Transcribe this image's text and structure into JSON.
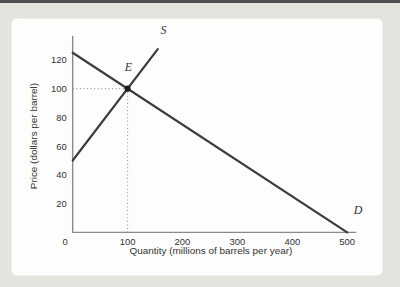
{
  "colors": {
    "background": "#e3e3e0",
    "top_bar": "#4f4f4f",
    "panel": "#fdfdfd",
    "panel_border": "#efefec",
    "axis": "#8a8a8a",
    "line": "#3c3c3c",
    "dotted": "#9a9a9a",
    "text": "#333333",
    "point": "#1c1c1c"
  },
  "chart_data": {
    "type": "line",
    "title": "",
    "xlabel": "Quantity (millions of barrels per year)",
    "ylabel": "Price (dollars per barrel)",
    "xlim": [
      0,
      500
    ],
    "ylim": [
      0,
      125
    ],
    "x_ticks": [
      0,
      100,
      200,
      300,
      400,
      500
    ],
    "y_ticks": [
      20,
      40,
      60,
      80,
      100,
      120
    ],
    "grid": false,
    "legend": "none",
    "series": [
      {
        "name": "supply",
        "label": "S",
        "points": [
          [
            0,
            50
          ],
          [
            155,
            127.5
          ]
        ],
        "label_pos": [
          160,
          138
        ]
      },
      {
        "name": "demand",
        "label": "D",
        "points": [
          [
            0,
            125
          ],
          [
            500,
            0
          ]
        ],
        "label_pos": [
          512,
          13
        ]
      }
    ],
    "equilibrium": {
      "label": "E",
      "x": 100,
      "y": 100,
      "price": 100,
      "quantity": 100,
      "label_pos": [
        95,
        112
      ]
    }
  }
}
